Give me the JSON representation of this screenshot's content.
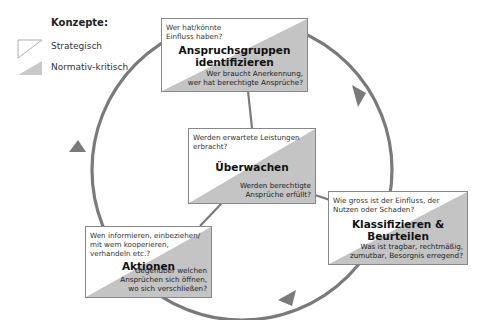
{
  "legend": {
    "title": "Konzepte:",
    "items": [
      {
        "label": "Strategisch",
        "icon": "white-triangle-icon"
      },
      {
        "label": "Normativ-kritisch",
        "icon": "gray-triangle-icon"
      }
    ]
  },
  "colors": {
    "normative_fill": "#c4c4c4",
    "cycle_stroke": "#7a7a7a",
    "box_border": "#888888"
  },
  "boxes": [
    {
      "id": "anspruchsgruppen",
      "strategic_question": "Wer hat/könnte Einfluss haben?",
      "title_line1": "Anspruchsgruppen",
      "title_line2": "identifizieren",
      "normative_question_line1": "Wer braucht Anerkennung,",
      "normative_question_line2": "wer hat berechtigte Ansprüche?"
    },
    {
      "id": "ueberwachen",
      "strategic_question_line1": "Werden erwartete Leistungen",
      "strategic_question_line2": "erbracht?",
      "title_line1": "Überwachen",
      "normative_question_line1": "Werden berechtigte",
      "normative_question_line2": "Ansprüche erfüllt?"
    },
    {
      "id": "klassifizieren",
      "strategic_question_line1": "Wie gross ist der Einfluss, der",
      "strategic_question_line2": "Nutzen oder Schaden?",
      "title_line1": "Klassifizieren &",
      "title_line2": "Beurteilen",
      "normative_question_line1": "Was ist tragbar, rechtmäßig,",
      "normative_question_line2": "zumutbar, Besorgnis erregend?"
    },
    {
      "id": "aktionen",
      "strategic_question_line1": "Wen informieren, einbeziehen/",
      "strategic_question_line2": "mit wem kooperieren,",
      "strategic_question_line3": "verhandeln etc.?",
      "title_line1": "Aktionen",
      "normative_question_line1": "Gegenüber welchen",
      "normative_question_line2": "Ansprüchen sich öffnen,",
      "normative_question_line3": "wo sich verschließen?"
    }
  ],
  "cycle": {
    "direction": "clockwise",
    "arrow_icons": [
      "arrow-head-right-icon",
      "arrow-head-bottom-icon",
      "arrow-head-left-icon"
    ]
  }
}
